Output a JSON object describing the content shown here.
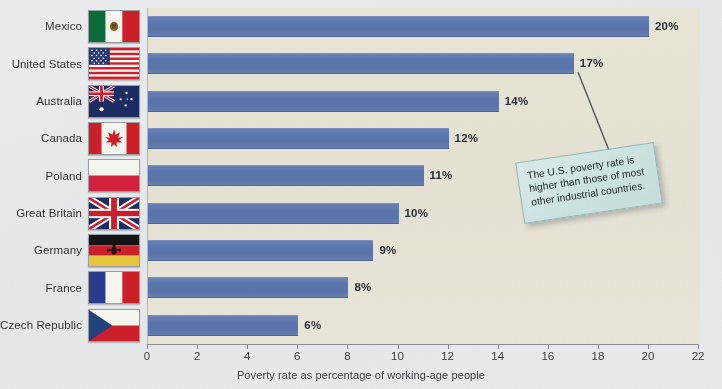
{
  "chart_data": {
    "type": "bar",
    "orientation": "horizontal",
    "title": "",
    "xlabel": "Poverty rate as percentage of working-age people",
    "ylabel": "",
    "xlim": [
      0,
      22
    ],
    "xticks": [
      0,
      2,
      4,
      6,
      8,
      10,
      12,
      14,
      16,
      18,
      20,
      22
    ],
    "grid": false,
    "legend": null,
    "categories": [
      "Mexico",
      "United States",
      "Australia",
      "Canada",
      "Poland",
      "Great Britain",
      "Germany",
      "France",
      "Czech Republic"
    ],
    "values": [
      20,
      17,
      14,
      12,
      11,
      10,
      9,
      8,
      6
    ],
    "data_labels": [
      "20%",
      "17%",
      "14%",
      "12%",
      "11%",
      "10%",
      "9%",
      "8%",
      "6%"
    ],
    "annotations": [
      {
        "text": "The U.S. poverty rate is higher than those of most other industrial countries.",
        "points_to_category": "United States"
      }
    ],
    "bar_color": "#5b76ad",
    "plot_background": "#e7e3d5"
  },
  "axis": {
    "xlabel": "Poverty rate as percentage of working-age people",
    "ticks": [
      "0",
      "2",
      "4",
      "6",
      "8",
      "10",
      "12",
      "14",
      "16",
      "18",
      "20",
      "22"
    ]
  },
  "rows": [
    {
      "label": "Mexico",
      "value": 20,
      "value_label": "20%",
      "flag": "flag-mexico"
    },
    {
      "label": "United States",
      "value": 17,
      "value_label": "17%",
      "flag": "flag-united-states"
    },
    {
      "label": "Australia",
      "value": 14,
      "value_label": "14%",
      "flag": "flag-australia"
    },
    {
      "label": "Canada",
      "value": 12,
      "value_label": "12%",
      "flag": "flag-canada"
    },
    {
      "label": "Poland",
      "value": 11,
      "value_label": "11%",
      "flag": "flag-poland"
    },
    {
      "label": "Great Britain",
      "value": 10,
      "value_label": "10%",
      "flag": "flag-great-britain"
    },
    {
      "label": "Germany",
      "value": 9,
      "value_label": "9%",
      "flag": "flag-germany"
    },
    {
      "label": "France",
      "value": 8,
      "value_label": "8%",
      "flag": "flag-france"
    },
    {
      "label": "Czech Republic",
      "value": 6,
      "value_label": "6%",
      "flag": "flag-czech-republic"
    }
  ],
  "callout": {
    "text": "The U.S. poverty rate is higher than those of most other industrial countries.",
    "background": "#cce3e1",
    "border": "#8fbcbb"
  },
  "colors": {
    "bar": "#5b76ad",
    "plot_bg": "#e7e3d5",
    "page_bg": "#e9eaec",
    "text": "#2f3336"
  }
}
